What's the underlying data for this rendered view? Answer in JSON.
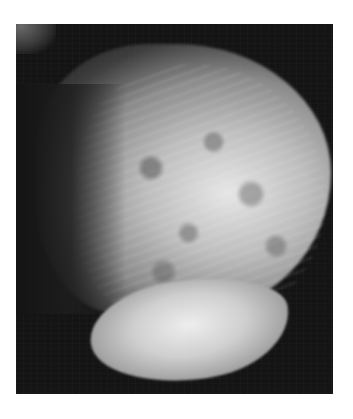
{
  "image": {
    "type": "mammogram",
    "colors": {
      "background": "#ffffff",
      "film": "#141414",
      "tissue_bright": "#e6e6e6"
    }
  }
}
